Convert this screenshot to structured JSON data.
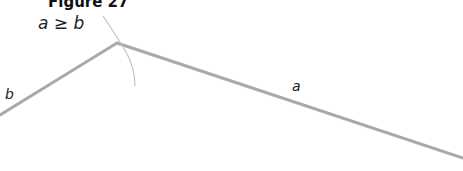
{
  "figure": {
    "title": "Figure 27",
    "condition": "a ≥ b",
    "labels": {
      "left_side": "b",
      "right_side": "a"
    }
  },
  "geometry": {
    "apex": [
      117,
      43
    ],
    "left_end": [
      0,
      115
    ],
    "right_end": [
      463,
      158
    ],
    "line_color": "#a9a9a9",
    "arc_color": "#c4c4c4"
  }
}
